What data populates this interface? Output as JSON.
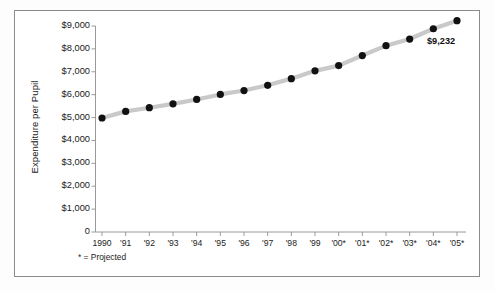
{
  "chart_data": {
    "type": "line",
    "title": "",
    "xlabel": "",
    "ylabel": "Expenditure per Pupil",
    "categories": [
      "1990",
      "'91",
      "'92",
      "'93",
      "'94",
      "'95",
      "'96",
      "'97",
      "'98",
      "'99",
      "'00*",
      "'01*",
      "'02*",
      "'03*",
      "'04*",
      "'05*"
    ],
    "values": [
      4980,
      5270,
      5430,
      5600,
      5790,
      6010,
      6180,
      6410,
      6700,
      7040,
      7270,
      7710,
      8140,
      8430,
      8880,
      9232
    ],
    "ylim": [
      0,
      9500
    ],
    "yticks": [
      0,
      1000,
      2000,
      3000,
      4000,
      5000,
      6000,
      7000,
      8000,
      9000
    ],
    "ytick_labels": [
      "0",
      "$1,000",
      "$2,000",
      "$3,000",
      "$4,000",
      "$5,000",
      "$6,000",
      "$7,000",
      "$8,000",
      "$9,000"
    ],
    "grid": false,
    "legend": null,
    "line_color": "#c9c9c9",
    "marker_color": "#111111",
    "annotations": [
      {
        "label": "$9,232",
        "category": "'05*",
        "value": 9232
      }
    ],
    "footnote": "* = Projected"
  },
  "figure": {
    "footnote": "* = Projected",
    "end_label": "$9,232",
    "axis_label_y": "Expenditure per Pupil"
  }
}
